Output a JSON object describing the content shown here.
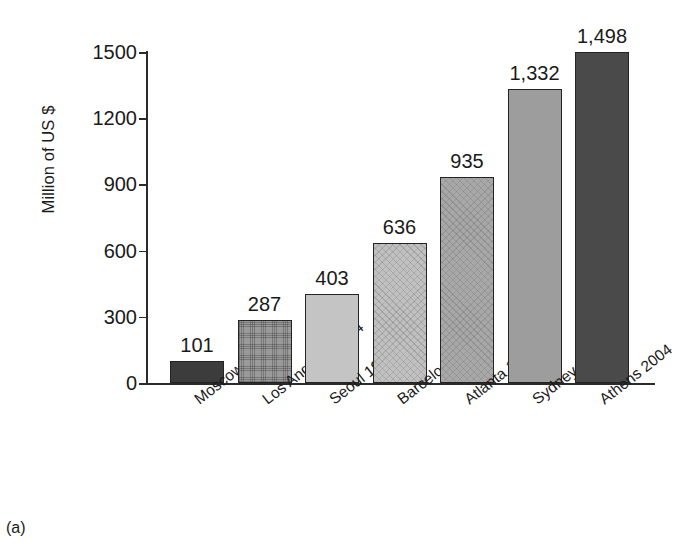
{
  "caption": "(a)",
  "chart_data": {
    "type": "bar",
    "title": "",
    "xlabel": "",
    "ylabel": "Million of US $",
    "categories": [
      "Moscow 1980",
      "Los Angeles 1984",
      "Seoul 1988",
      "Barcelona 1992",
      "Atlanta 1996",
      "Sydney 2000",
      "Athens 2004"
    ],
    "values": [
      101,
      287,
      403,
      636,
      935,
      1332,
      1498
    ],
    "value_labels": [
      "101",
      "287",
      "403",
      "636",
      "935",
      "1,332",
      "1,498"
    ],
    "ylim": [
      0,
      1500
    ],
    "yticks": [
      0,
      300,
      600,
      900,
      1200,
      1500
    ],
    "ytick_labels": [
      "0",
      "300",
      "600",
      "900",
      "1200",
      "1500"
    ],
    "grid": false,
    "legend": "none",
    "bar_styles": [
      {
        "fill": "#3c3c3c",
        "texture": "plain"
      },
      {
        "fill": "#9a9a9a",
        "texture": "dots"
      },
      {
        "fill": "#c4c4c4",
        "texture": "plain"
      },
      {
        "fill": "#c0c0c0",
        "texture": "hatch"
      },
      {
        "fill": "#a8a8a8",
        "texture": "hatch"
      },
      {
        "fill": "#9d9d9d",
        "texture": "plain"
      },
      {
        "fill": "#4a4a4a",
        "texture": "plain"
      }
    ]
  }
}
